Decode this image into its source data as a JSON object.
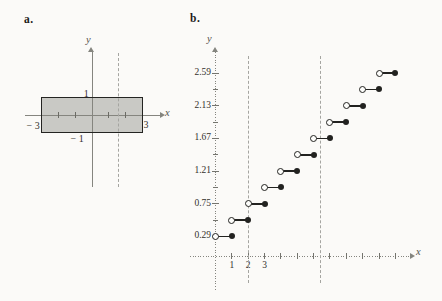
{
  "page": {
    "background": "#fbfaf8"
  },
  "chart_data": [
    {
      "panel_label": "a.",
      "type": "area",
      "subtype": "shaded-rectangle-region",
      "xlabel": "x",
      "ylabel": "y",
      "region": {
        "x_min": -3,
        "x_max": 3,
        "y_min": -1,
        "y_max": 1
      },
      "x_axis_ticks": [
        -2,
        -1,
        1,
        2
      ],
      "dashed_lines_x": [
        1.6
      ],
      "annotations": [
        {
          "text": "1",
          "x": -0.2,
          "y": 1.33,
          "align": "right"
        },
        {
          "text": "− 1",
          "x": -0.5,
          "y": -1.35,
          "align": "right"
        },
        {
          "text": "− 3",
          "x": -3.55,
          "y": -0.6,
          "align": "center"
        },
        {
          "text": "3",
          "x": 3.25,
          "y": -0.55,
          "align": "center"
        }
      ],
      "xlim": [
        -4,
        4.3
      ],
      "ylim": [
        -4.3,
        3.8
      ],
      "grid": false,
      "colors": {
        "region_fill": "#c9c9c5",
        "region_border": "#242422",
        "axis": "#85857f",
        "tick": "#6b6b65",
        "dashed": "#a5a5a1"
      }
    },
    {
      "panel_label": "b.",
      "type": "line",
      "subtype": "step-function",
      "xlabel": "x",
      "ylabel": "y",
      "x_axis": {
        "ticks": [
          1,
          2,
          3,
          4,
          5,
          6,
          7,
          8,
          9,
          10,
          11
        ],
        "tick_labels": [
          {
            "text": "1",
            "value": 1
          },
          {
            "text": "2",
            "value": 2
          },
          {
            "text": "3",
            "value": 3
          }
        ]
      },
      "y_axis": {
        "tick_labels": [
          {
            "text": "0.29",
            "value": 0.29
          },
          {
            "text": "0.75",
            "value": 0.75
          },
          {
            "text": "1.21",
            "value": 1.21
          },
          {
            "text": "1.67",
            "value": 1.67
          },
          {
            "text": "2.13",
            "value": 2.13
          },
          {
            "text": "2.59",
            "value": 2.59
          }
        ],
        "minor_ticks": [
          0.52,
          0.98,
          1.44,
          1.9,
          2.36
        ]
      },
      "dashed_lines_x": [
        2,
        6.4
      ],
      "steps": [
        {
          "x_start": 0,
          "x_end": 1,
          "y": 0.29,
          "left_endpoint": "open",
          "right_endpoint": "closed"
        },
        {
          "x_start": 1,
          "x_end": 2,
          "y": 0.52,
          "left_endpoint": "open",
          "right_endpoint": "closed"
        },
        {
          "x_start": 2,
          "x_end": 3,
          "y": 0.75,
          "left_endpoint": "open",
          "right_endpoint": "closed"
        },
        {
          "x_start": 3,
          "x_end": 4,
          "y": 0.98,
          "left_endpoint": "open",
          "right_endpoint": "closed"
        },
        {
          "x_start": 4,
          "x_end": 5,
          "y": 1.21,
          "left_endpoint": "open",
          "right_endpoint": "closed"
        },
        {
          "x_start": 5,
          "x_end": 6,
          "y": 1.44,
          "left_endpoint": "open",
          "right_endpoint": "closed"
        },
        {
          "x_start": 6,
          "x_end": 7,
          "y": 1.67,
          "left_endpoint": "open",
          "right_endpoint": "closed"
        },
        {
          "x_start": 7,
          "x_end": 8,
          "y": 1.9,
          "left_endpoint": "open",
          "right_endpoint": "closed"
        },
        {
          "x_start": 8,
          "x_end": 9,
          "y": 2.13,
          "left_endpoint": "open",
          "right_endpoint": "closed"
        },
        {
          "x_start": 9,
          "x_end": 10,
          "y": 2.36,
          "left_endpoint": "open",
          "right_endpoint": "closed"
        },
        {
          "x_start": 10,
          "x_end": 11,
          "y": 2.59,
          "left_endpoint": "open",
          "right_endpoint": "closed"
        }
      ],
      "xlim": [
        0,
        12.2
      ],
      "ylim": [
        0,
        2.9
      ],
      "grid": false,
      "colors": {
        "line": "#222220",
        "axis": "#85857f",
        "tick": "#74746e",
        "dashed": "#a5a5a1"
      }
    }
  ]
}
